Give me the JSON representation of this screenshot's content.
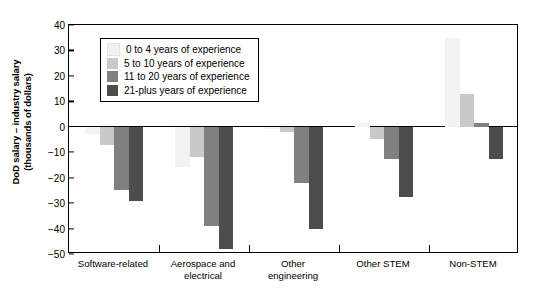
{
  "chart_data": {
    "type": "bar",
    "title": "",
    "xlabel": "",
    "ylabel": "DoD salary – industry salary (thousands of dollars)",
    "ylim": [
      -50,
      40
    ],
    "ytick_values": [
      40,
      30,
      20,
      10,
      0,
      -10,
      -20,
      -30,
      -40,
      -50
    ],
    "ytick_labels": [
      "40",
      "30",
      "20",
      "10",
      "0",
      "−10",
      "−20",
      "−30",
      "−40",
      "−50"
    ],
    "grid": false,
    "legend_position": "upper-left-inside",
    "categories": [
      "Software-related",
      "Aerospace and electrical",
      "Other engineering",
      "Other STEM",
      "Non-STEM"
    ],
    "series": [
      {
        "name": "0 to 4 years of experience",
        "color": "#f2f2f2",
        "values": [
          -3,
          -16,
          -1,
          1.5,
          35
        ]
      },
      {
        "name": "5 to 10 years of experience",
        "color": "#c9c9c9",
        "values": [
          -7,
          -12,
          -2,
          -5,
          13
        ]
      },
      {
        "name": "11 to 20 years of experience",
        "color": "#808080",
        "values": [
          -25,
          -39,
          -22,
          -12.5,
          1.5
        ]
      },
      {
        "name": "21-plus years of experience",
        "color": "#4d4d4d",
        "values": [
          -29,
          -48,
          -40,
          -27.5,
          -12.5
        ]
      }
    ]
  },
  "axis": {
    "y_title_line1": "DoD salary – industry salary",
    "y_title_line2": "(thousands of dollars)"
  },
  "xlabels": [
    {
      "line1": "Software-related",
      "line2": ""
    },
    {
      "line1": "Aerospace and",
      "line2": "electrical"
    },
    {
      "line1": "Other",
      "line2": "engineering"
    },
    {
      "line1": "Other STEM",
      "line2": ""
    },
    {
      "line1": "Non-STEM",
      "line2": ""
    }
  ]
}
